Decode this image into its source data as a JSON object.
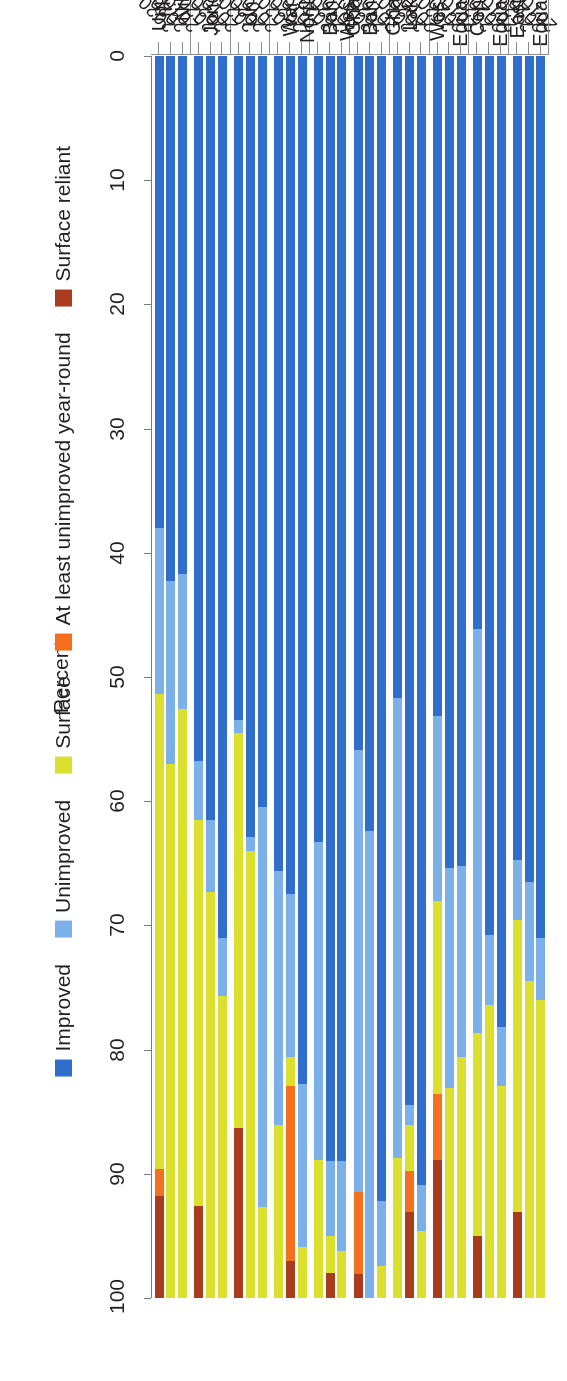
{
  "chart_data": {
    "type": "bar",
    "orientation": "horizontal-stacked",
    "title": "",
    "xlabel": "Percent",
    "ylabel": "",
    "xlim": [
      0,
      100
    ],
    "xticks": [
      "0",
      "10",
      "20",
      "30",
      "40",
      "50",
      "60",
      "70",
      "80",
      "90",
      "100"
    ],
    "grid": false,
    "legend_position": "bottom",
    "stack_order": [
      "Improved",
      "Unimproved",
      "Surface",
      "At least unimproved year-round",
      "Surface reliant"
    ],
    "series": [
      {
        "name": "Improved",
        "color": "#2f6fcb"
      },
      {
        "name": "Unimproved",
        "color": "#7bb0e8"
      },
      {
        "name": "Surface",
        "color": "#dbe02f"
      },
      {
        "name": "At least unimproved year-round",
        "color": "#f4701f"
      },
      {
        "name": "Surface reliant",
        "color": "#a83c1c"
      }
    ],
    "categories": [
      "Upper Nile",
      "Jonglei",
      "Unity",
      "Warrap",
      "Northern\nBahr el\nGhazal",
      "Western\nBahr el\nGhazal",
      "Lakes",
      "Western\nEquatoria",
      "Central\nEquatoria",
      "Eastern\nEquatoria"
    ],
    "years": [
      "2010",
      "2020",
      "2020"
    ],
    "groups": [
      {
        "category": "Upper Nile",
        "bars": [
          {
            "year": "2010",
            "values": [
              41.7,
              10.9,
              47.4,
              0,
              0
            ]
          },
          {
            "year": "2020",
            "values": [
              42.3,
              14.7,
              43.0,
              0,
              0
            ]
          },
          {
            "year": "2020",
            "values": [
              38.0,
              13.4,
              38.2,
              2.2,
              8.2
            ]
          }
        ]
      },
      {
        "category": "Jonglei",
        "bars": [
          {
            "year": "2010",
            "values": [
              71.0,
              4.7,
              24.3,
              0,
              0
            ]
          },
          {
            "year": "2020",
            "values": [
              61.5,
              5.8,
              32.7,
              0,
              0
            ]
          },
          {
            "year": "2020",
            "values": [
              56.8,
              4.7,
              31.1,
              0,
              7.4
            ]
          }
        ]
      },
      {
        "category": "Unity",
        "bars": [
          {
            "year": "2010",
            "values": [
              60.5,
              32.2,
              7.3,
              0,
              0
            ]
          },
          {
            "year": "2020",
            "values": [
              62.9,
              1.1,
              36.0,
              0,
              0
            ]
          },
          {
            "year": "2020",
            "values": [
              53.5,
              1.0,
              31.8,
              0,
              13.7
            ]
          }
        ]
      },
      {
        "category": "Warrap",
        "bars": [
          {
            "year": "2010",
            "values": [
              82.8,
              13.1,
              4.1,
              0,
              0
            ]
          },
          {
            "year": "2020",
            "values": [
              67.5,
              13.1,
              2.3,
              14.1,
              3.0
            ]
          },
          {
            "year": "2020",
            "values": [
              65.6,
              20.5,
              13.9,
              0,
              0
            ]
          }
        ]
      },
      {
        "category": "Northern\nBahr el\nGhazal",
        "bars": [
          {
            "year": "2010",
            "values": [
              89.0,
              7.2,
              3.8,
              0,
              0
            ]
          },
          {
            "year": "2020",
            "values": [
              89.0,
              6.0,
              3.0,
              0,
              2.0
            ]
          },
          {
            "year": "2020",
            "values": [
              63.3,
              25.6,
              11.1,
              0,
              0
            ]
          }
        ]
      },
      {
        "category": "Western\nBahr el\nGhazal",
        "bars": [
          {
            "year": "2010",
            "values": [
              92.2,
              5.2,
              2.6,
              0,
              0
            ]
          },
          {
            "year": "2020",
            "values": [
              62.4,
              37.6,
              0,
              0,
              0
            ]
          },
          {
            "year": "2020",
            "values": [
              55.9,
              35.6,
              0,
              6.6,
              1.9
            ]
          }
        ]
      },
      {
        "category": "Lakes",
        "bars": [
          {
            "year": "2010",
            "values": [
              90.9,
              3.7,
              5.4,
              0,
              0
            ]
          },
          {
            "year": "2020",
            "values": [
              84.5,
              1.6,
              3.7,
              3.3,
              6.9
            ]
          },
          {
            "year": "2020",
            "values": [
              51.7,
              37.0,
              11.3,
              0,
              0
            ]
          }
        ]
      },
      {
        "category": "Western\nEquatoria",
        "bars": [
          {
            "year": "2010",
            "values": [
              65.2,
              15.4,
              19.4,
              0,
              0
            ]
          },
          {
            "year": "2020",
            "values": [
              65.4,
              17.7,
              16.9,
              0,
              0
            ]
          },
          {
            "year": "2020",
            "values": [
              53.1,
              14.9,
              15.6,
              5.3,
              11.1
            ]
          }
        ]
      },
      {
        "category": "Central\nEquatoria",
        "bars": [
          {
            "year": "2010",
            "values": [
              78.2,
              4.7,
              17.1,
              0,
              0
            ]
          },
          {
            "year": "2020",
            "values": [
              70.8,
              5.6,
              23.6,
              0,
              0
            ]
          },
          {
            "year": "2020",
            "values": [
              46.1,
              32.6,
              16.3,
              0,
              5.0
            ]
          }
        ]
      },
      {
        "category": "Eastern\nEquatoria",
        "bars": [
          {
            "year": "2010",
            "values": [
              71.0,
              5.0,
              24.0,
              0,
              0
            ]
          },
          {
            "year": "2020",
            "values": [
              66.5,
              8.0,
              25.5,
              0,
              0
            ]
          },
          {
            "year": "2020",
            "values": [
              64.7,
              4.9,
              23.5,
              0,
              6.9
            ]
          }
        ]
      }
    ]
  },
  "axis": {
    "title": "Percent"
  },
  "legend": {
    "items": [
      {
        "label": "Improved",
        "color": "#2f6fcb",
        "icon": "legend-swatch-improved"
      },
      {
        "label": "Unimproved",
        "color": "#7bb0e8",
        "icon": "legend-swatch-unimproved"
      },
      {
        "label": "Surface",
        "color": "#dbe02f",
        "icon": "legend-swatch-surface"
      },
      {
        "label": "At least unimproved year-round",
        "color": "#f4701f",
        "icon": "legend-swatch-at-least-unimproved"
      },
      {
        "label": "Surface reliant",
        "color": "#a83c1c",
        "icon": "legend-swatch-surface-reliant"
      }
    ]
  }
}
